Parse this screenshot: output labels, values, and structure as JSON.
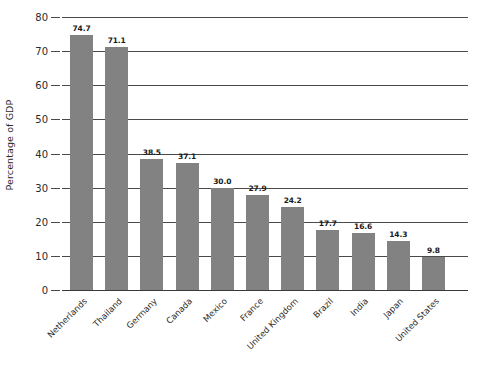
{
  "chart_data": {
    "type": "bar",
    "title": "",
    "subtitle": "",
    "xlabel": "",
    "ylabel": "Percentage of GDP",
    "ylim": [
      0,
      80
    ],
    "yticks": [
      0,
      10,
      20,
      30,
      40,
      50,
      60,
      70,
      80
    ],
    "ytick_labels": [
      "0",
      "10",
      "20",
      "30",
      "40",
      "50",
      "60",
      "70",
      "80"
    ],
    "grid": true,
    "legend": false,
    "legend_position": "none",
    "bar_color": "#828282",
    "gridline_color": "#4a4a4a",
    "orientation": "vertical",
    "categories": [
      "Netherlands",
      "Thailand",
      "Germany",
      "Canada",
      "Mexico",
      "France",
      "United Kingdom",
      "Brazil",
      "India",
      "Japan",
      "United States"
    ],
    "values": [
      74.7,
      71.1,
      38.5,
      37.1,
      30.0,
      27.9,
      24.2,
      17.7,
      16.6,
      14.3,
      9.8
    ],
    "value_labels": [
      "74.7",
      "71.1",
      "38.5",
      "37.1",
      "30.0",
      "27.9",
      "24.2",
      "17.7",
      "16.6",
      "14.3",
      "9.8"
    ]
  }
}
